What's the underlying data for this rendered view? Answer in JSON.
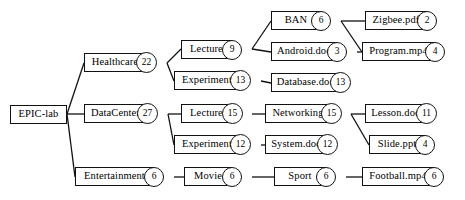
{
  "diagram": {
    "type": "tree",
    "stroke_color": "#111111",
    "background_color": "#ffffff",
    "nodes": [
      {
        "id": "epic-lab",
        "label": "EPIC-lab",
        "badge": null,
        "x": 10,
        "y": 105,
        "w": 57,
        "h": 19,
        "bw": 0
      },
      {
        "id": "healthcare",
        "label": "Healthcare",
        "badge": "22",
        "x": 84,
        "y": 53,
        "w": 62,
        "h": 19,
        "bw": 21
      },
      {
        "id": "datacenter",
        "label": "DataCenter",
        "badge": "27",
        "x": 84,
        "y": 104,
        "w": 63,
        "h": 19,
        "bw": 21
      },
      {
        "id": "entertainment",
        "label": "Entertainment",
        "badge": "6",
        "x": 75,
        "y": 167,
        "w": 79,
        "h": 19,
        "bw": 20
      },
      {
        "id": "lecture-h",
        "label": "Lecture",
        "badge": "9",
        "x": 181,
        "y": 40,
        "w": 51,
        "h": 19,
        "bw": 20
      },
      {
        "id": "experiment-h",
        "label": "Experiment",
        "badge": "13",
        "x": 174,
        "y": 71,
        "w": 66,
        "h": 19,
        "bw": 21
      },
      {
        "id": "lecture-d",
        "label": "Lecture",
        "badge": "15",
        "x": 181,
        "y": 104,
        "w": 51,
        "h": 19,
        "bw": 21
      },
      {
        "id": "experiment-d",
        "label": "Experiment",
        "badge": "12",
        "x": 174,
        "y": 135,
        "w": 66,
        "h": 19,
        "bw": 21
      },
      {
        "id": "movie",
        "label": "Movie",
        "badge": "6",
        "x": 184,
        "y": 167,
        "w": 48,
        "h": 19,
        "bw": 20
      },
      {
        "id": "ban",
        "label": "BAN",
        "badge": "6",
        "x": 271,
        "y": 11,
        "w": 50,
        "h": 19,
        "bw": 20
      },
      {
        "id": "android-doc",
        "label": "Android.doc",
        "badge": "3",
        "x": 271,
        "y": 42,
        "w": 66,
        "h": 19,
        "bw": 20
      },
      {
        "id": "database-doc",
        "label": "Database.doc",
        "badge": "13",
        "x": 271,
        "y": 73,
        "w": 69,
        "h": 19,
        "bw": 21
      },
      {
        "id": "networking",
        "label": "Networking",
        "badge": "15",
        "x": 265,
        "y": 104,
        "w": 66,
        "h": 19,
        "bw": 21
      },
      {
        "id": "system-doc",
        "label": "System.doc",
        "badge": "12",
        "x": 265,
        "y": 135,
        "w": 62,
        "h": 19,
        "bw": 21
      },
      {
        "id": "sport",
        "label": "Sport",
        "badge": "6",
        "x": 274,
        "y": 167,
        "w": 52,
        "h": 19,
        "bw": 20
      },
      {
        "id": "zigbee-pdf",
        "label": "Zigbee.pdf",
        "badge": "2",
        "x": 365,
        "y": 11,
        "w": 62,
        "h": 19,
        "bw": 20
      },
      {
        "id": "program-mp4",
        "label": "Program.mp4",
        "badge": "4",
        "x": 362,
        "y": 42,
        "w": 73,
        "h": 19,
        "bw": 20
      },
      {
        "id": "lesson-doc",
        "label": "Lesson.doc",
        "badge": "11",
        "x": 365,
        "y": 104,
        "w": 61,
        "h": 19,
        "bw": 21
      },
      {
        "id": "slide-ppt",
        "label": "Slide.ppt",
        "badge": "4",
        "x": 369,
        "y": 135,
        "w": 56,
        "h": 19,
        "bw": 20
      },
      {
        "id": "football-mp4",
        "label": "Football.mp4",
        "badge": "6",
        "x": 362,
        "y": 167,
        "w": 72,
        "h": 19,
        "bw": 20
      }
    ],
    "edges": [
      {
        "from": "epic-lab",
        "to": "healthcare",
        "x1": 67,
        "y1": 114,
        "x2": 84,
        "y2": 63
      },
      {
        "from": "epic-lab",
        "to": "datacenter",
        "x1": 67,
        "y1": 114,
        "x2": 84,
        "y2": 114
      },
      {
        "from": "epic-lab",
        "to": "entertainment",
        "x1": 67,
        "y1": 114,
        "x2": 75,
        "y2": 177
      },
      {
        "from": "healthcare",
        "to": "lecture-h",
        "x1": 167,
        "y1": 63,
        "x2": 181,
        "y2": 49
      },
      {
        "from": "healthcare",
        "to": "experiment-h",
        "x1": 167,
        "y1": 63,
        "x2": 174,
        "y2": 81
      },
      {
        "from": "datacenter",
        "to": "lecture-d",
        "x1": 168,
        "y1": 114,
        "x2": 181,
        "y2": 114
      },
      {
        "from": "datacenter",
        "to": "experiment-d",
        "x1": 168,
        "y1": 114,
        "x2": 174,
        "y2": 145
      },
      {
        "from": "entertainment",
        "to": "movie",
        "x1": 174,
        "y1": 177,
        "x2": 184,
        "y2": 177
      },
      {
        "from": "lecture-h",
        "to": "ban",
        "x1": 252,
        "y1": 49,
        "x2": 271,
        "y2": 21
      },
      {
        "from": "lecture-h",
        "to": "android-doc",
        "x1": 252,
        "y1": 49,
        "x2": 271,
        "y2": 52
      },
      {
        "from": "experiment-h",
        "to": "database-doc",
        "x1": 261,
        "y1": 81,
        "x2": 271,
        "y2": 83
      },
      {
        "from": "lecture-d",
        "to": "networking",
        "x1": 252,
        "y1": 114,
        "x2": 265,
        "y2": 114
      },
      {
        "from": "experiment-d",
        "to": "system-doc",
        "x1": 261,
        "y1": 145,
        "x2": 265,
        "y2": 145
      },
      {
        "from": "movie",
        "to": "sport",
        "x1": 252,
        "y1": 177,
        "x2": 274,
        "y2": 177
      },
      {
        "from": "ban",
        "to": "zigbee-pdf",
        "x1": 341,
        "y1": 21,
        "x2": 365,
        "y2": 21
      },
      {
        "from": "ban",
        "to": "program-mp4",
        "x1": 341,
        "y1": 21,
        "x2": 362,
        "y2": 52
      },
      {
        "from": "android-doc",
        "to": "program-mp4",
        "x1": 357,
        "y1": 52,
        "x2": 362,
        "y2": 52
      },
      {
        "from": "networking",
        "to": "lesson-doc",
        "x1": 351,
        "y1": 114,
        "x2": 365,
        "y2": 114
      },
      {
        "from": "networking",
        "to": "slide-ppt",
        "x1": 351,
        "y1": 114,
        "x2": 369,
        "y2": 145
      },
      {
        "from": "sport",
        "to": "football-mp4",
        "x1": 346,
        "y1": 177,
        "x2": 362,
        "y2": 177
      }
    ]
  }
}
